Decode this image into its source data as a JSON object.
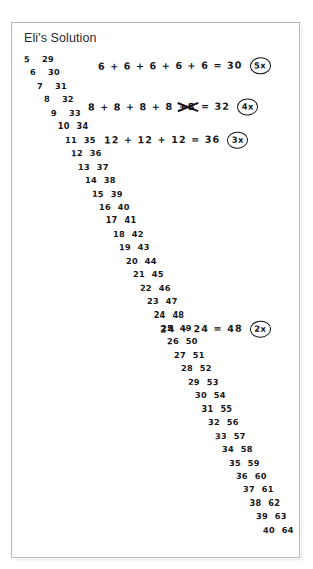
{
  "worksheet": {
    "title": "Eli's Solution",
    "number_list": {
      "left_column_label": "n",
      "right_column_label": "n + 24",
      "rows": [
        {
          "left": "5",
          "right": "29"
        },
        {
          "left": "6",
          "right": "30"
        },
        {
          "left": "7",
          "right": "31"
        },
        {
          "left": "8",
          "right": "32"
        },
        {
          "left": "9",
          "right": "33"
        },
        {
          "left": "10",
          "right": "34"
        },
        {
          "left": "11",
          "right": "35"
        },
        {
          "left": "12",
          "right": "36"
        },
        {
          "left": "13",
          "right": "37"
        },
        {
          "left": "14",
          "right": "38"
        },
        {
          "left": "15",
          "right": "39"
        },
        {
          "left": "16",
          "right": "40"
        },
        {
          "left": "17",
          "right": "41"
        },
        {
          "left": "18",
          "right": "42"
        },
        {
          "left": "19",
          "right": "43"
        },
        {
          "left": "20",
          "right": "44"
        },
        {
          "left": "21",
          "right": "45"
        },
        {
          "left": "22",
          "right": "46"
        },
        {
          "left": "23",
          "right": "47"
        },
        {
          "left": "24",
          "right": "48"
        },
        {
          "left": "25",
          "right": "49"
        },
        {
          "left": "26",
          "right": "50"
        },
        {
          "left": "27",
          "right": "51"
        },
        {
          "left": "28",
          "right": "52"
        },
        {
          "left": "29",
          "right": "53"
        },
        {
          "left": "30",
          "right": "54"
        },
        {
          "left": "31",
          "right": "55"
        },
        {
          "left": "32",
          "right": "56"
        },
        {
          "left": "33",
          "right": "57"
        },
        {
          "left": "34",
          "right": "58"
        },
        {
          "left": "35",
          "right": "59"
        },
        {
          "left": "36",
          "right": "60"
        },
        {
          "left": "37",
          "right": "61"
        },
        {
          "left": "38",
          "right": "62"
        },
        {
          "left": "39",
          "right": "63"
        },
        {
          "left": "40",
          "right": "64"
        }
      ]
    },
    "equations": [
      {
        "expression_before": "6 + 6 + 6 + 6 + 6",
        "struck_term": "",
        "expression_after": "= 30",
        "multiplier": "5x"
      },
      {
        "expression_before": "8 + 8 + 8 + 8",
        "struck_term": "+8",
        "expression_after": "= 32",
        "multiplier": "4x"
      },
      {
        "expression_before": "12 + 12 + 12",
        "struck_term": "",
        "expression_after": "= 36",
        "multiplier": "3x"
      },
      {
        "expression_before": "24 + 24",
        "struck_term": "",
        "expression_after": "= 48",
        "multiplier": "2x"
      }
    ]
  },
  "colors": {
    "ink": "#15151a",
    "frame": "#b7b7b7",
    "paper": "#ffffff",
    "heading": "#2b2b2b"
  }
}
